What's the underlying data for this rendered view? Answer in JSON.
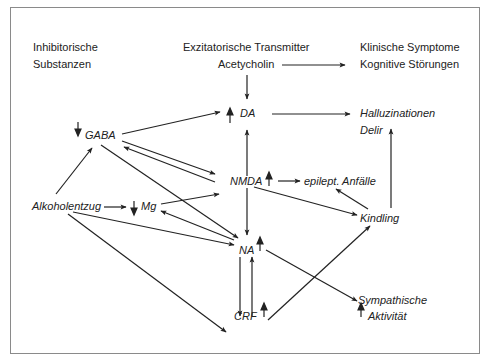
{
  "headers": {
    "inhibitory_line1": "Inhibitorische",
    "inhibitory_line2": "Substanzen",
    "excitatory": "Exzitatorische Transmitter",
    "clinical": "Klinische Symptome"
  },
  "nodes": {
    "acetylcholin": "Acetycholin",
    "kognitive": "Kognitive Störungen",
    "da": "DA",
    "halluzinationen": "Halluzinationen",
    "delir": "Delir",
    "gaba": "GABA",
    "nmda": "NMDA",
    "epilept": "epilept. Anfälle",
    "alkoholentzug": "Alkoholentzug",
    "mg": "Mg",
    "kindling": "Kindling",
    "na": "NA",
    "crf": "CRF",
    "sympathische": "Sympathische",
    "aktivitaet": "Aktivität"
  },
  "indicators": {
    "gaba": "down",
    "mg": "down",
    "da": "up",
    "nmda": "up",
    "na": "up",
    "crf": "up",
    "aktivitaet": "up"
  },
  "edges": [
    [
      "Acetycholin",
      "Kognitive Störungen"
    ],
    [
      "Acetycholin",
      "DA"
    ],
    [
      "DA",
      "Halluzinationen"
    ],
    [
      "GABA",
      "DA"
    ],
    [
      "GABA",
      "NMDA"
    ],
    [
      "NMDA",
      "GABA"
    ],
    [
      "GABA",
      "NA"
    ],
    [
      "Alkoholentzug",
      "GABA"
    ],
    [
      "Alkoholentzug",
      "Mg"
    ],
    [
      "Alkoholentzug",
      "NA"
    ],
    [
      "Alkoholentzug",
      "CRF"
    ],
    [
      "Mg",
      "NMDA"
    ],
    [
      "NA",
      "Mg"
    ],
    [
      "NMDA",
      "DA"
    ],
    [
      "NMDA",
      "NA"
    ],
    [
      "NMDA",
      "epilept. Anfälle"
    ],
    [
      "NMDA",
      "Kindling"
    ],
    [
      "Kindling",
      "epilept. Anfälle"
    ],
    [
      "Kindling",
      "Halluzinationen"
    ],
    [
      "NA",
      "CRF"
    ],
    [
      "CRF",
      "NA"
    ],
    [
      "CRF",
      "Kindling"
    ],
    [
      "NA",
      "Sympathische Aktivität"
    ]
  ]
}
